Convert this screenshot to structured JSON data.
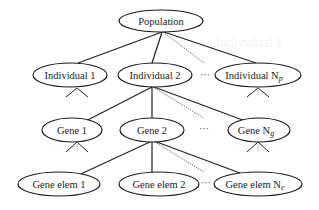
{
  "diagram": {
    "type": "hierarchy-tree",
    "background_ghost_text": "Individual 1",
    "root": {
      "id": "population",
      "label": "Population"
    },
    "levels": [
      {
        "name": "individuals",
        "nodes": [
          {
            "id": "individual-1",
            "label": "Individual 1"
          },
          {
            "id": "individual-2",
            "label": "Individual 2"
          },
          {
            "id": "individual-np",
            "label": "Individual N",
            "subscript": "p"
          }
        ],
        "ellipsis": "···"
      },
      {
        "name": "genes",
        "parent": "individual-2",
        "nodes": [
          {
            "id": "gene-1",
            "label": "Gene 1"
          },
          {
            "id": "gene-2",
            "label": "Gene 2"
          },
          {
            "id": "gene-ng",
            "label": "Gene N",
            "subscript": "g"
          }
        ],
        "ellipsis": "···"
      },
      {
        "name": "gene-elements",
        "parent": "gene-2",
        "nodes": [
          {
            "id": "gene-elem-1",
            "label": "Gene elem 1"
          },
          {
            "id": "gene-elem-2",
            "label": "Gene elem 2"
          },
          {
            "id": "gene-elem-ne",
            "label": "Gene elem N",
            "subscript": "e"
          }
        ],
        "ellipsis": "···"
      }
    ],
    "colors": {
      "stroke": "#1a1a1a",
      "dotted_edge": "#555555",
      "background": "#ffffff"
    }
  }
}
